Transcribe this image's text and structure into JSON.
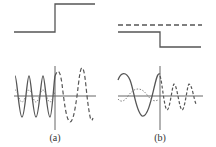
{
  "figure": {
    "panels": [
      {
        "id": "a",
        "label": "(a)",
        "top": {
          "type": "step-up",
          "description": "potential step rising at boundary"
        },
        "bottom": {
          "left_wave": "solid, short wavelength",
          "right_wave": "dashed, long wavelength, larger amplitude"
        }
      },
      {
        "id": "b",
        "label": "(b)",
        "top": {
          "type": "step-down",
          "description": "potential step dropping at boundary, dashed energy level above"
        },
        "bottom": {
          "left_wave": "solid, long wavelength, with dotted reflected wave",
          "right_wave": "dashed, short wavelength, smaller amplitude"
        }
      }
    ]
  },
  "colors": {
    "line": "#555555",
    "axis": "#666666",
    "background": "#ffffff"
  }
}
